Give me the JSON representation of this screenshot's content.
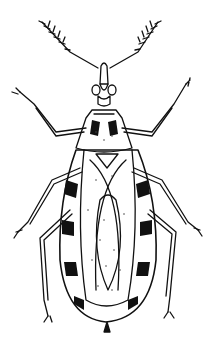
{
  "figure": {
    "style": "black ink line drawing on white",
    "colors": {
      "ink": "#111111",
      "background": "#ffffff",
      "stipple": "#555555"
    }
  }
}
